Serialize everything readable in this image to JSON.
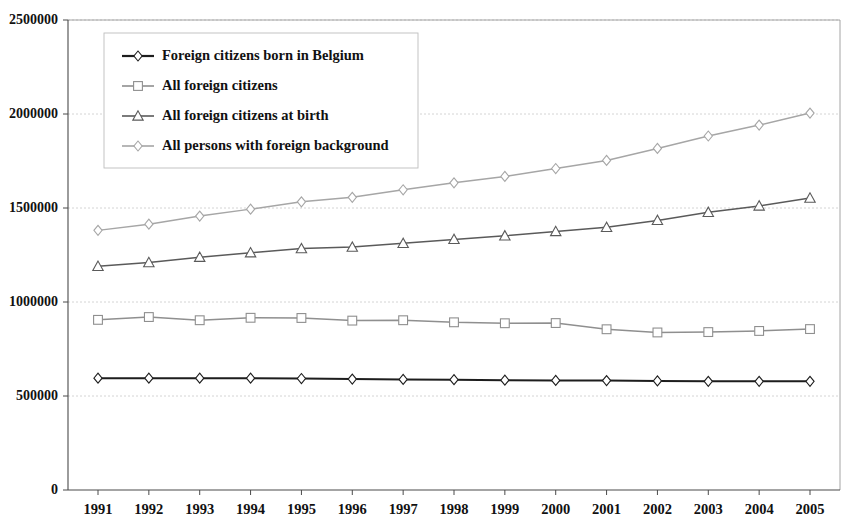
{
  "chart_data": {
    "type": "line",
    "title": "",
    "subtitle": "",
    "xlabel": "",
    "ylabel": "",
    "x": [
      1991,
      1992,
      1993,
      1994,
      1995,
      1996,
      1997,
      1998,
      1999,
      2000,
      2001,
      2002,
      2003,
      2004,
      2005
    ],
    "categories": [
      "1991",
      "1992",
      "1993",
      "1994",
      "1995",
      "1996",
      "1997",
      "1998",
      "1999",
      "2000",
      "2001",
      "2002",
      "2003",
      "2004",
      "2005"
    ],
    "xlim": [
      1991,
      2005
    ],
    "ylim": [
      0,
      2500000
    ],
    "ytick_values": [
      0,
      500000,
      1000000,
      1500000,
      2000000,
      2500000
    ],
    "ytick_labels": [
      "0",
      "500000",
      "1000000",
      "1500000",
      "2000000",
      "2500000"
    ],
    "grid": true,
    "grid_axis": "y",
    "legend_position": "upper-left-inside",
    "series": [
      {
        "name": "Foreign citizens born in Belgium",
        "marker": "diamond",
        "color": "#1d1d1d",
        "values": [
          595000,
          595000,
          595000,
          595000,
          593000,
          590000,
          588000,
          587000,
          584000,
          583000,
          582000,
          580000,
          578000,
          578000,
          578000
        ]
      },
      {
        "name": "All foreign citizens",
        "marker": "square",
        "color": "#8f8f8f",
        "values": [
          905000,
          920000,
          903000,
          916000,
          915000,
          901000,
          903000,
          892000,
          887000,
          888000,
          855000,
          838000,
          840000,
          846000,
          856000
        ]
      },
      {
        "name": "All foreign citizens at birth",
        "marker": "triangle",
        "color": "#5a5a5a",
        "values": [
          1190000,
          1210000,
          1238000,
          1262000,
          1284000,
          1292000,
          1312000,
          1333000,
          1352000,
          1375000,
          1397000,
          1434000,
          1477000,
          1511000,
          1553000
        ]
      },
      {
        "name": "All persons with foreign background",
        "marker": "diamond-open",
        "color": "#a6a6a6",
        "values": [
          1381000,
          1414000,
          1457000,
          1494000,
          1533000,
          1557000,
          1597000,
          1634000,
          1668000,
          1710000,
          1753000,
          1817000,
          1883000,
          1941000,
          2005000
        ]
      }
    ]
  },
  "legend": {
    "entries": [
      {
        "label": "Foreign citizens born in Belgium"
      },
      {
        "label": "All foreign citizens"
      },
      {
        "label": "All foreign citizens at birth"
      },
      {
        "label": "All persons with foreign background"
      }
    ]
  },
  "axes": {
    "y_labels": [
      "2500000",
      "2000000",
      "1500000",
      "1000000",
      "500000",
      "0"
    ],
    "x_labels": [
      "1991",
      "1992",
      "1993",
      "1994",
      "1995",
      "1996",
      "1997",
      "1998",
      "1999",
      "2000",
      "2001",
      "2002",
      "2003",
      "2004",
      "2005"
    ]
  },
  "colors": {
    "background": "#ffffff",
    "grid": "#c9c9c9",
    "axis": "#4a4a4a",
    "series_dark": "#1d1d1d",
    "series_mid": "#5a5a5a",
    "series_gray": "#8f8f8f",
    "series_light": "#a6a6a6"
  }
}
